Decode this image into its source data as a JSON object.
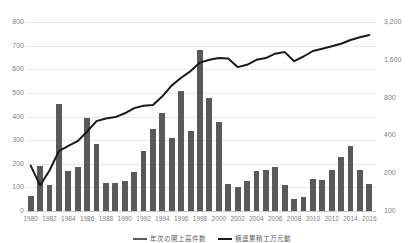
{
  "chart_data": {
    "type": "bar",
    "title": "",
    "subtitle": "",
    "xlabel": "",
    "ylabel": "",
    "grid": true,
    "legend_position": "bottom",
    "categories": [
      "1980",
      "1981",
      "1982",
      "1983",
      "1984",
      "1985",
      "1986",
      "1987",
      "1988",
      "1989",
      "1990",
      "1991",
      "1992",
      "1993",
      "1994",
      "1995",
      "1996",
      "1997",
      "1998",
      "1999",
      "2000",
      "2001",
      "2002",
      "2003",
      "2004",
      "2005",
      "2006",
      "2007",
      "2008",
      "2009",
      "2010",
      "2011",
      "2012",
      "2013",
      "2014",
      "2015",
      "2016"
    ],
    "x_tick_labels": [
      "1980",
      "1982",
      "1984",
      "1986",
      "1988",
      "1990",
      "1992",
      "1994",
      "1996",
      "1998",
      "2000",
      "2002",
      "2004",
      "2006",
      "2008",
      "2010",
      "2012",
      "2014",
      "2016"
    ],
    "left_axis": {
      "label": "",
      "ticks": [
        "0",
        "100",
        "200",
        "300",
        "400",
        "500",
        "600",
        "700",
        "800"
      ],
      "tick_values": [
        0,
        100,
        200,
        300,
        400,
        500,
        600,
        700,
        800
      ],
      "ylim": [
        0,
        800
      ],
      "scale": "linear"
    },
    "right_axis": {
      "label": "",
      "ticks": [
        "100",
        "200",
        "400",
        "800",
        "1,600",
        "3,200"
      ],
      "tick_values": [
        100,
        200,
        400,
        800,
        1600,
        3200
      ],
      "ylim": [
        100,
        3200
      ],
      "scale": "log"
    },
    "series": [
      {
        "name": "bars",
        "axis": "left",
        "type": "bar",
        "color": "#595959",
        "legend_label": "年次の開上高件数",
        "values": [
          65,
          190,
          110,
          455,
          170,
          185,
          395,
          285,
          120,
          120,
          125,
          165,
          255,
          345,
          415,
          310,
          510,
          340,
          680,
          480,
          375,
          115,
          100,
          125,
          170,
          175,
          185,
          110,
          50,
          60,
          135,
          130,
          175,
          230,
          275,
          175,
          115
        ]
      },
      {
        "name": "line",
        "axis": "right",
        "type": "line",
        "color": "#1a1a1a",
        "legend_label": "横連累積工万元動",
        "values": [
          230,
          160,
          210,
          300,
          330,
          360,
          430,
          520,
          545,
          560,
          600,
          660,
          690,
          700,
          820,
          1000,
          1150,
          1300,
          1520,
          1600,
          1650,
          1640,
          1400,
          1460,
          1600,
          1650,
          1790,
          1850,
          1560,
          1700,
          1880,
          1960,
          2050,
          2150,
          2300,
          2420,
          2520
        ]
      }
    ]
  },
  "legend": {
    "items": [
      {
        "label": "年次の開上高件数",
        "marker": "bar-swatch",
        "color": "#595959"
      },
      {
        "label": "横連累積工万元動",
        "marker": "line-swatch",
        "color": "#1a1a1a"
      }
    ]
  }
}
